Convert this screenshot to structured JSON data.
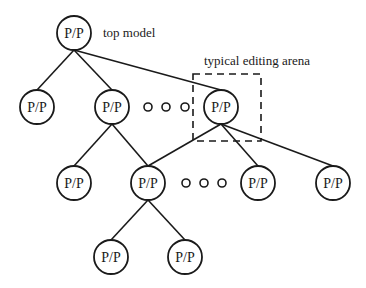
{
  "diagram": {
    "title": "",
    "node_label": "P/P",
    "annotations": {
      "top": "top model",
      "arena": "typical editing arena"
    },
    "colors": {
      "stroke": "#1a1a1a",
      "background": "#ffffff"
    },
    "nodes": [
      {
        "id": "root",
        "x": 74,
        "y": 33,
        "label": "P/P"
      },
      {
        "id": "l2a",
        "x": 37,
        "y": 107,
        "label": "P/P"
      },
      {
        "id": "l2b",
        "x": 112,
        "y": 107,
        "label": "P/P"
      },
      {
        "id": "l2c",
        "x": 221,
        "y": 107,
        "label": "P/P"
      },
      {
        "id": "l3a",
        "x": 74,
        "y": 183,
        "label": "P/P"
      },
      {
        "id": "l3b",
        "x": 148,
        "y": 183,
        "label": "P/P"
      },
      {
        "id": "l3c",
        "x": 258,
        "y": 183,
        "label": "P/P"
      },
      {
        "id": "l3d",
        "x": 333,
        "y": 183,
        "label": "P/P"
      },
      {
        "id": "l4a",
        "x": 111,
        "y": 257,
        "label": "P/P"
      },
      {
        "id": "l4b",
        "x": 185,
        "y": 257,
        "label": "P/P"
      }
    ],
    "edges": [
      [
        "root",
        "l2a"
      ],
      [
        "root",
        "l2b"
      ],
      [
        "root",
        "l2c"
      ],
      [
        "l2b",
        "l3a"
      ],
      [
        "l2b",
        "l3b"
      ],
      [
        "l2c",
        "l3b"
      ],
      [
        "l2c",
        "l3c"
      ],
      [
        "l2c",
        "l3d"
      ],
      [
        "l3b",
        "l4a"
      ],
      [
        "l3b",
        "l4b"
      ]
    ],
    "ellipses": [
      {
        "y": 107,
        "xs": [
          148,
          166,
          185
        ]
      },
      {
        "y": 183,
        "xs": [
          186,
          204,
          222
        ]
      }
    ],
    "arena_box": {
      "x": 193,
      "y": 74,
      "w": 68,
      "h": 67
    }
  }
}
